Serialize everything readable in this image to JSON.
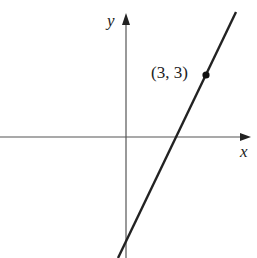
{
  "figure": {
    "type": "coordinate-plane-line",
    "axes": {
      "x_label": "x",
      "y_label": "y"
    },
    "point": {
      "label": "(3, 3)",
      "x": 3,
      "y": 3
    },
    "line": {
      "slope_sign": "positive",
      "passes_through": [
        3,
        3
      ]
    },
    "colors": {
      "ink": "#222222",
      "axis": "#555555",
      "background": "#ffffff"
    }
  }
}
